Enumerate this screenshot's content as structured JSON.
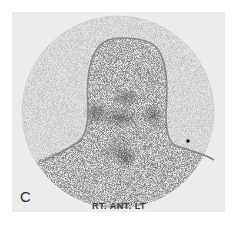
{
  "figure": {
    "panel_letter": "C",
    "view_label": "RT. ANT. LT",
    "colors": {
      "background": "#ececec",
      "outline": "#8a8a8a",
      "counts": "#222222"
    }
  }
}
